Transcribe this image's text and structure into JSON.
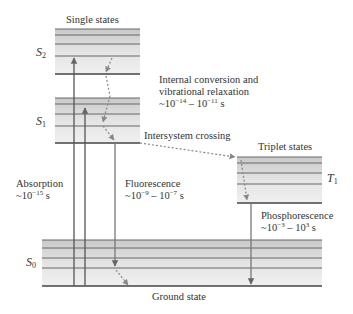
{
  "labels": {
    "singlet_states": "Single states",
    "triplet_states": "Triplet states",
    "ground_state": "Ground state",
    "s2": "S",
    "s2_sub": "2",
    "s1": "S",
    "s1_sub": "1",
    "s0": "S",
    "s0_sub": "0",
    "t1": "T",
    "t1_sub": "1"
  },
  "processes": {
    "internal_conversion": {
      "line1": "Internal conversion and",
      "line2": "vibrational relaxation",
      "time_prefix": "~10",
      "exp1": "−14",
      "mid": " – 10",
      "exp2": "−11",
      "unit": " s"
    },
    "intersystem_crossing": {
      "label": "Intersystem crossing"
    },
    "absorption": {
      "label": "Absorption",
      "time_prefix": "~10",
      "exp1": "−15",
      "unit": " s"
    },
    "fluorescence": {
      "label": "Fluorescence",
      "time_prefix": "~10",
      "exp1": "−9",
      "mid": " – 10",
      "exp2": "−7",
      "unit": " s"
    },
    "phosphorescence": {
      "label": "Phosphorescence",
      "time_prefix": "~10",
      "exp1": "−3",
      "mid": " – 10",
      "exp2": "3",
      "unit": " s"
    }
  },
  "colors": {
    "band_light": "#e6e6e6",
    "band_dark": "#c8c8c8",
    "line": "#555555",
    "arrow": "#666666",
    "dotted": "#888888"
  }
}
